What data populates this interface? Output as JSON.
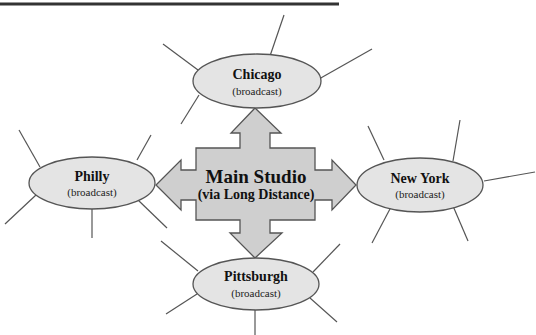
{
  "diagram": {
    "hub": {
      "title": "Main Studio",
      "subtitle": "(via Long Distance)"
    },
    "nodes": {
      "chicago": {
        "title": "Chicago",
        "subtitle": "(broadcast)"
      },
      "philly": {
        "title": "Philly",
        "subtitle": "(broadcast)"
      },
      "new_york": {
        "title": "New York",
        "subtitle": "(broadcast)"
      },
      "pittsburgh": {
        "title": "Pittsburgh",
        "subtitle": "(broadcast)"
      }
    },
    "colors": {
      "node_fill": "#e4e4e4",
      "hub_fill": "#cfcfcf",
      "stroke": "#555555",
      "text": "#111111"
    }
  }
}
